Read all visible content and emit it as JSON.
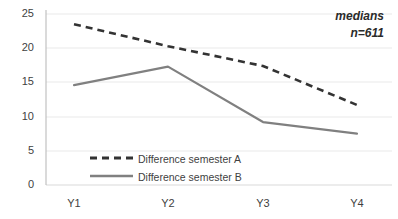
{
  "chart_data": {
    "type": "line",
    "title": "",
    "xlabel": "",
    "ylabel": "",
    "categories": [
      "Y1",
      "Y2",
      "Y3",
      "Y4"
    ],
    "series": [
      {
        "name": "Difference semester A",
        "values": [
          23.5,
          20.3,
          17.4,
          11.7
        ],
        "style": "dashed",
        "color": "#333333"
      },
      {
        "name": "Difference semester B",
        "values": [
          14.6,
          17.3,
          9.2,
          7.5
        ],
        "style": "solid",
        "color": "#808080"
      }
    ],
    "ylim": [
      0,
      25
    ],
    "yticks": [
      0,
      5,
      10,
      15,
      20,
      25
    ],
    "ytick_labels": [
      "0",
      "5",
      "10",
      "15",
      "20",
      "25"
    ],
    "grid": true,
    "grid_color": "#e8e8e8",
    "legend_position": "inside-bottom-left"
  },
  "annotation": {
    "line1": "medians",
    "line2": "n=611"
  },
  "legend": {
    "items": [
      {
        "label": "Difference semester A"
      },
      {
        "label": "Difference semester B"
      }
    ]
  },
  "axis": {
    "y_labels": [
      "25",
      "20",
      "15",
      "10",
      "5",
      "0"
    ],
    "x_labels": [
      "Y1",
      "Y2",
      "Y3",
      "Y4"
    ]
  }
}
